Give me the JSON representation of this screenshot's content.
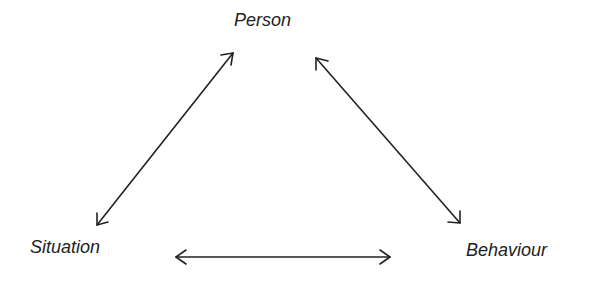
{
  "diagram": {
    "nodes": [
      {
        "id": "person",
        "label": "Person"
      },
      {
        "id": "situation",
        "label": "Situation"
      },
      {
        "id": "behaviour",
        "label": "Behaviour"
      }
    ],
    "edges": [
      {
        "from": "person",
        "to": "situation",
        "type": "bidirectional"
      },
      {
        "from": "person",
        "to": "behaviour",
        "type": "bidirectional"
      },
      {
        "from": "situation",
        "to": "behaviour",
        "type": "bidirectional"
      }
    ],
    "colors": {
      "line": "#222222",
      "text": "#222222",
      "background": "#ffffff"
    }
  }
}
